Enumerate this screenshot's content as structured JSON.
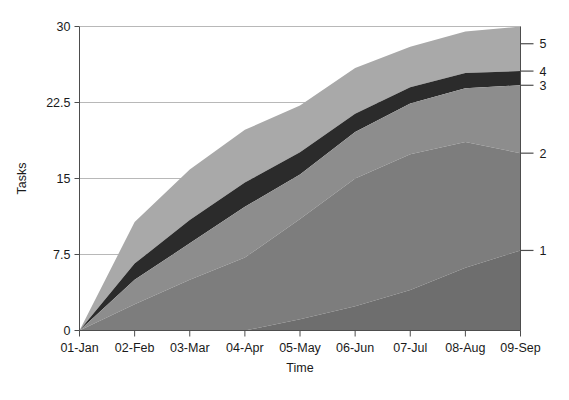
{
  "chart_data": {
    "type": "area",
    "title": "",
    "subtitle": "",
    "xlabel": "Time",
    "ylabel": "Tasks",
    "stacked": true,
    "grid": true,
    "legend_position": "right-axis",
    "categories": [
      "01-Jan",
      "02-Feb",
      "03-Mar",
      "04-Apr",
      "05-May",
      "06-Jun",
      "07-Jul",
      "08-Aug",
      "09-Sep"
    ],
    "x_tick_labels": [
      "01-Jan",
      "02-Feb",
      "03-Mar",
      "04-Apr",
      "05-May",
      "06-Jun",
      "07-Jul",
      "08-Aug",
      "09-Sep"
    ],
    "y_tick_labels": [
      "0",
      "7.5",
      "15",
      "22.5",
      "30"
    ],
    "y_ticks": [
      0,
      7.5,
      15,
      22.5,
      30
    ],
    "ylim": [
      0,
      30
    ],
    "xlim": [
      0,
      8
    ],
    "right_axis_labels": [
      "1",
      "2",
      "3",
      "4",
      "5"
    ],
    "right_axis_values": [
      7.9,
      17.5,
      24.2,
      25.6,
      28.3
    ],
    "series": [
      {
        "name": "1",
        "color": "#6e6e6e",
        "values": [
          0.0,
          0.0,
          0.0,
          0.0,
          1.1,
          2.4,
          4.0,
          6.2,
          7.9
        ]
      },
      {
        "name": "2",
        "color": "#7d7d7d",
        "values": [
          0.0,
          2.6,
          5.0,
          7.2,
          9.9,
          12.6,
          13.4,
          12.4,
          9.6
        ]
      },
      {
        "name": "3",
        "color": "#8d8d8d",
        "values": [
          0.0,
          2.4,
          3.6,
          5.0,
          4.4,
          4.6,
          5.0,
          5.3,
          6.7
        ]
      },
      {
        "name": "4",
        "color": "#2b2b2b",
        "values": [
          0.0,
          1.6,
          2.3,
          2.4,
          2.2,
          1.8,
          1.6,
          1.5,
          1.4
        ]
      },
      {
        "name": "5",
        "color": "#a9a9a9",
        "values": [
          0.0,
          4.1,
          5.0,
          5.2,
          4.6,
          4.5,
          4.0,
          4.1,
          4.4
        ]
      }
    ],
    "cumulative": [
      {
        "name": "1",
        "values": [
          0.0,
          0.0,
          0.0,
          0.0,
          1.1,
          2.4,
          4.0,
          6.2,
          7.9
        ]
      },
      {
        "name": "2",
        "values": [
          0.0,
          2.6,
          5.0,
          7.2,
          11.0,
          15.0,
          17.4,
          18.6,
          17.5
        ]
      },
      {
        "name": "3",
        "values": [
          0.0,
          5.0,
          8.6,
          12.2,
          15.4,
          19.6,
          22.4,
          23.9,
          24.2
        ]
      },
      {
        "name": "4",
        "values": [
          0.0,
          6.6,
          10.9,
          14.6,
          17.6,
          21.4,
          24.0,
          25.4,
          25.6
        ]
      },
      {
        "name": "5",
        "values": [
          0.0,
          10.7,
          15.9,
          19.8,
          22.2,
          25.9,
          28.0,
          29.5,
          30.0
        ]
      }
    ],
    "colors": {
      "series_1": "#6e6e6e",
      "series_2": "#7d7d7d",
      "series_3": "#8d8d8d",
      "series_4": "#2b2b2b",
      "series_5": "#a9a9a9",
      "axis": "#4d4d4d",
      "grid": "#b8b8b8",
      "background": "#ffffff",
      "text": "#1a1a1a"
    }
  }
}
